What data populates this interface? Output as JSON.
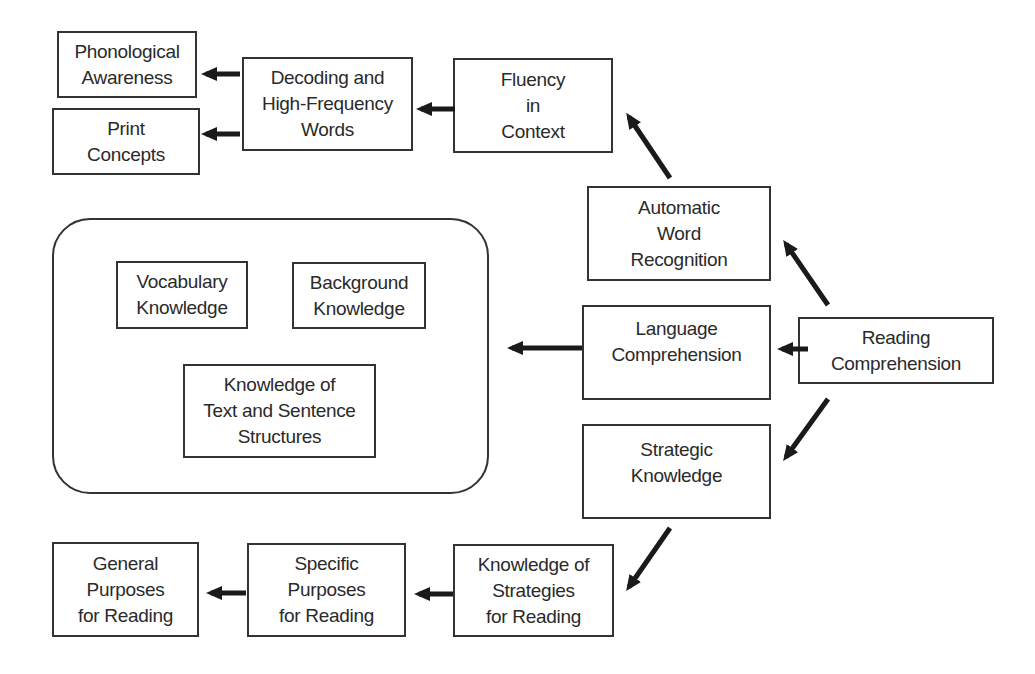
{
  "diagram": {
    "type": "flow-diagram",
    "root": "Reading Comprehension",
    "nodes": {
      "reading_comprehension": {
        "lines": [
          "Reading",
          "Comprehension"
        ]
      },
      "automatic_word_recognition": {
        "lines": [
          "Automatic",
          "Word",
          "Recognition"
        ]
      },
      "language_comprehension": {
        "lines": [
          "Language",
          "Comprehension"
        ]
      },
      "strategic_knowledge": {
        "lines": [
          "Strategic",
          "Knowledge"
        ]
      },
      "fluency_in_context": {
        "lines": [
          "Fluency",
          "in",
          "Context"
        ]
      },
      "decoding_hfw": {
        "lines": [
          "Decoding and",
          "High-Frequency",
          "Words"
        ]
      },
      "phonological_awareness": {
        "lines": [
          "Phonological",
          "Awareness"
        ]
      },
      "print_concepts": {
        "lines": [
          "Print",
          "Concepts"
        ]
      },
      "vocabulary_knowledge": {
        "lines": [
          "Vocabulary",
          "Knowledge"
        ]
      },
      "background_knowledge": {
        "lines": [
          "Background",
          "Knowledge"
        ]
      },
      "text_sentence_structures": {
        "lines": [
          "Knowledge of",
          "Text and Sentence",
          "Structures"
        ]
      },
      "knowledge_of_strategies": {
        "lines": [
          "Knowledge of",
          "Strategies",
          "for Reading"
        ]
      },
      "specific_purposes": {
        "lines": [
          "Specific",
          "Purposes",
          "for Reading"
        ]
      },
      "general_purposes": {
        "lines": [
          "General",
          "Purposes",
          "for Reading"
        ]
      }
    },
    "edges": [
      {
        "from": "Reading Comprehension",
        "to": "Automatic Word Recognition"
      },
      {
        "from": "Reading Comprehension",
        "to": "Language Comprehension"
      },
      {
        "from": "Reading Comprehension",
        "to": "Strategic Knowledge"
      },
      {
        "from": "Automatic Word Recognition",
        "to": "Fluency in Context"
      },
      {
        "from": "Fluency in Context",
        "to": "Decoding and High-Frequency Words"
      },
      {
        "from": "Decoding and High-Frequency Words",
        "to": "Phonological Awareness"
      },
      {
        "from": "Decoding and High-Frequency Words",
        "to": "Print Concepts"
      },
      {
        "from": "Language Comprehension",
        "to": "Language knowledge group (Vocabulary, Background, Text and Sentence Structures)"
      },
      {
        "from": "Strategic Knowledge",
        "to": "Knowledge of Strategies for Reading"
      },
      {
        "from": "Knowledge of Strategies for Reading",
        "to": "Specific Purposes for Reading"
      },
      {
        "from": "Specific Purposes for Reading",
        "to": "General Purposes for Reading"
      }
    ],
    "colors": {
      "stroke": "#333333",
      "arrow": "#1a1a1a",
      "text": "#2a2a2a",
      "background": "#ffffff"
    }
  }
}
